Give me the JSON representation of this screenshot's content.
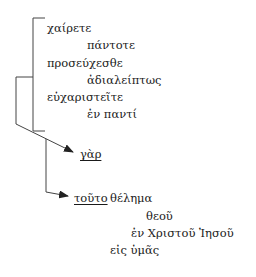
{
  "diagram": {
    "type": "sentence-flow",
    "line_color": "#333333",
    "lines": [
      {
        "id": "imperatives-bracket",
        "label": "bracket grouping three imperatives"
      },
      {
        "id": "arrow-to-gar",
        "label": "arrow to γὰρ"
      },
      {
        "id": "arrow-to-touto",
        "label": "arrow to τοῦτο"
      }
    ],
    "words": [
      {
        "text": "χαίρετε",
        "x": 47,
        "y": 21
      },
      {
        "text": "πάντοτε",
        "x": 87,
        "y": 38
      },
      {
        "text": "προσεύχεσθε",
        "x": 47,
        "y": 56
      },
      {
        "text": "ἀδιαλείπτως",
        "x": 87,
        "y": 73
      },
      {
        "text": "εὐχαριστεῖτε",
        "x": 47,
        "y": 90
      },
      {
        "text": "ἐν παντί",
        "x": 87,
        "y": 107
      },
      {
        "text": "γὰρ",
        "x": 80,
        "y": 147
      },
      {
        "text": "τοῦτο",
        "x": 74,
        "y": 191
      },
      {
        "text": "θέλημα",
        "x": 110,
        "y": 191
      },
      {
        "text": "θεοῦ",
        "x": 146,
        "y": 209
      },
      {
        "text": "ἐν Χριστοῦ Ἰησοῦ",
        "x": 131,
        "y": 226
      },
      {
        "text": "εἰς ὑμᾶς",
        "x": 110,
        "y": 243
      }
    ]
  }
}
